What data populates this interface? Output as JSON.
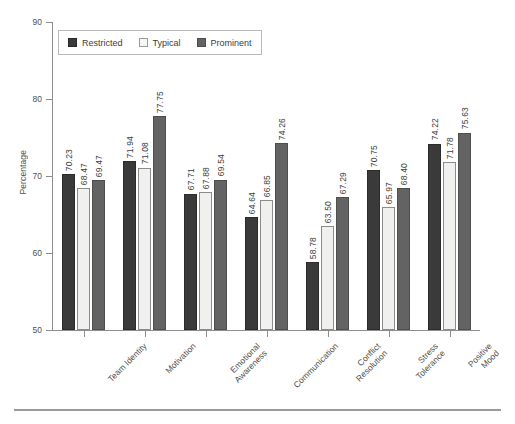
{
  "chart_data": {
    "type": "bar",
    "title": "",
    "xlabel": "",
    "ylabel": "Percentage",
    "ylim": [
      50,
      90
    ],
    "yticks": [
      50,
      60,
      70,
      80,
      90
    ],
    "grid": false,
    "legend_position": "upper-left-inside",
    "label_rotation": 90,
    "category_rotation": 45,
    "categories": [
      "Team Identity",
      "Motivation",
      "Emotional\nAwareness",
      "Communication",
      "Conflict\nResolution",
      "Stress\nTolerance",
      "Positive\nMood"
    ],
    "category_lines": [
      [
        "Team Identity"
      ],
      [
        "Motivation"
      ],
      [
        "Emotional",
        "Awareness"
      ],
      [
        "Communication"
      ],
      [
        "Conflict",
        "Resolution"
      ],
      [
        "Stress",
        "Tolerance"
      ],
      [
        "Positive",
        "Mood"
      ]
    ],
    "series": [
      {
        "name": "Restricted",
        "color": "#3a3a3a",
        "values": [
          70.23,
          71.94,
          67.71,
          64.64,
          58.78,
          70.75,
          74.22
        ],
        "labels": [
          "70.23",
          "71.94",
          "67.71",
          "64.64",
          "58.78",
          "70.75",
          "74.22"
        ]
      },
      {
        "name": "Typical",
        "color": "#f0f0ee",
        "values": [
          68.47,
          71.08,
          67.88,
          66.85,
          63.5,
          65.97,
          71.78
        ],
        "labels": [
          "68.47",
          "71.08",
          "67.88",
          "66.85",
          "63.50",
          "65.97",
          "71.78"
        ]
      },
      {
        "name": "Prominent",
        "color": "#636363",
        "values": [
          69.47,
          77.75,
          69.54,
          74.26,
          67.29,
          68.4,
          75.63
        ],
        "labels": [
          "69.47",
          "77.75",
          "69.54",
          "74.26",
          "67.29",
          "68.40",
          "75.63"
        ]
      }
    ]
  },
  "axis": {
    "y_title": "Percentage",
    "y_tick_labels": [
      "50",
      "60",
      "70",
      "80",
      "90"
    ]
  },
  "legend": {
    "entries": [
      {
        "label": "Restricted"
      },
      {
        "label": "Typical"
      },
      {
        "label": "Prominent"
      }
    ]
  }
}
